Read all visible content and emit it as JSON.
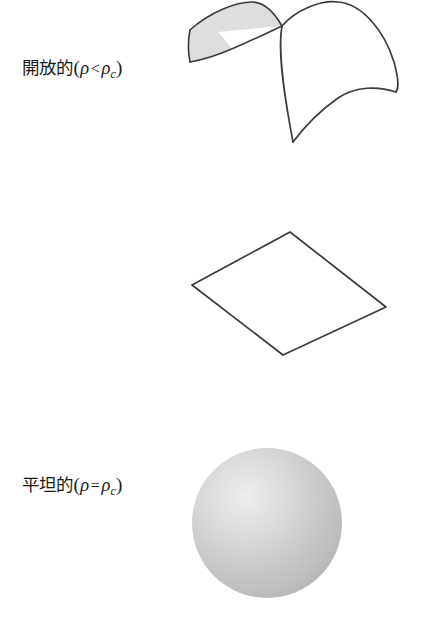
{
  "figure": {
    "type": "diagram",
    "background_color": "#ffffff",
    "stroke_color": "#3b3b3b",
    "rows": [
      {
        "id": "open",
        "label": {
          "term": "開放的",
          "open_paren": "(",
          "density_symbol": "ρ",
          "relation": "<",
          "critical_symbol": "ρ",
          "critical_subscript": "c",
          "close_paren": ")",
          "full_text": "開放的(ρ < ρc)"
        },
        "shape": {
          "name": "saddle-surface",
          "description": "hyperbolic-paraboloid",
          "fill": "#ffffff",
          "shaded_flap_fill": "#dedede"
        }
      },
      {
        "id": "flat",
        "label": {
          "term": "平坦的",
          "open_paren": "(",
          "density_symbol": "ρ",
          "relation": "=",
          "critical_symbol": "ρ",
          "critical_subscript": "c",
          "close_paren": ")",
          "full_text": "平坦的(ρ = ρc)"
        },
        "shape": {
          "name": "flat-plane",
          "description": "parallelogram",
          "fill": "#ffffff",
          "shaded_flap_fill": ""
        }
      },
      {
        "id": "closed",
        "label": {
          "term": "封閉的",
          "open_paren": "(",
          "density_symbol": "ρ",
          "relation": ">",
          "critical_symbol": "ρ",
          "critical_subscript": "c",
          "close_paren": ")",
          "full_text": "封閉的(ρ > ρc)"
        },
        "shape": {
          "name": "sphere",
          "description": "shaded-ball",
          "fill": "#b4b4b4",
          "shaded_flap_fill": "#e9e9e9"
        }
      }
    ]
  }
}
